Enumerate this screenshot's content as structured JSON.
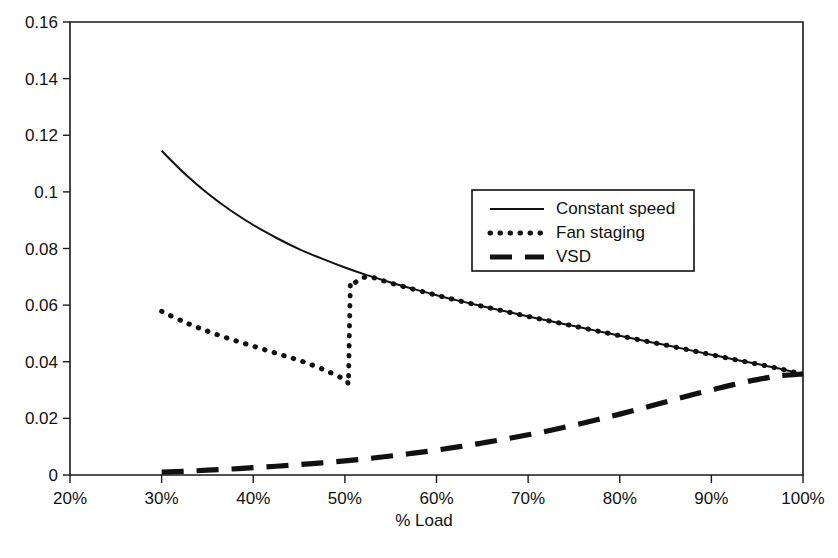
{
  "chart_data": {
    "type": "line",
    "title": "",
    "xlabel": "% Load",
    "ylabel": "",
    "xlim": [
      20,
      100
    ],
    "ylim": [
      0,
      0.16
    ],
    "grid": false,
    "legend_position": "inside-upper-right",
    "x_tick_labels": [
      "20%",
      "30%",
      "40%",
      "50%",
      "60%",
      "70%",
      "80%",
      "90%",
      "100%"
    ],
    "x_tick_values": [
      20,
      30,
      40,
      50,
      60,
      70,
      80,
      90,
      100
    ],
    "y_tick_labels": [
      "0",
      "0.02",
      "0.04",
      "0.06",
      "0.08",
      "0.1",
      "0.12",
      "0.14",
      "0.16"
    ],
    "y_tick_values": [
      0,
      0.02,
      0.04,
      0.06,
      0.08,
      0.1,
      0.12,
      0.14,
      0.16
    ],
    "series": [
      {
        "name": "Constant speed",
        "style": "solid",
        "x": [
          30,
          32.5,
          35,
          37.5,
          40,
          42.5,
          45,
          47.5,
          50,
          52.5,
          55,
          57.5,
          60,
          62.5,
          65,
          67.5,
          70,
          72.5,
          75,
          77.5,
          80,
          82.5,
          85,
          87.5,
          90,
          92.5,
          95,
          97.5,
          100
        ],
        "values": [
          0.1145,
          0.1065,
          0.0995,
          0.0935,
          0.0883,
          0.0838,
          0.0798,
          0.0764,
          0.0733,
          0.0705,
          0.068,
          0.0657,
          0.0635,
          0.0615,
          0.0596,
          0.0578,
          0.056,
          0.0543,
          0.0526,
          0.0509,
          0.0492,
          0.0475,
          0.0459,
          0.0442,
          0.0425,
          0.0408,
          0.0392,
          0.0375,
          0.0355
        ]
      },
      {
        "name": "Fan staging",
        "style": "dotted",
        "x": [
          30,
          32.5,
          35,
          37.5,
          40,
          42.5,
          45,
          47.5,
          50,
          50.4,
          50.5,
          50.6,
          51,
          52.5,
          55,
          57.5,
          60,
          62.5,
          65,
          67.5,
          70,
          72.5,
          75,
          77.5,
          80,
          82.5,
          85,
          87.5,
          90,
          92.5,
          95,
          97.5,
          100
        ],
        "values": [
          0.0578,
          0.054,
          0.0508,
          0.048,
          0.0455,
          0.043,
          0.0405,
          0.0375,
          0.0338,
          0.0335,
          0.052,
          0.0672,
          0.0678,
          0.07,
          0.0678,
          0.0656,
          0.0635,
          0.0615,
          0.0596,
          0.0578,
          0.056,
          0.0543,
          0.0526,
          0.0509,
          0.0492,
          0.0475,
          0.0459,
          0.0442,
          0.0425,
          0.0408,
          0.0392,
          0.0375,
          0.0355
        ]
      },
      {
        "name": "VSD",
        "style": "dashed",
        "x": [
          30,
          32.5,
          35,
          37.5,
          40,
          42.5,
          45,
          47.5,
          50,
          52.5,
          55,
          57.5,
          60,
          62.5,
          65,
          67.5,
          70,
          72.5,
          75,
          77.5,
          80,
          82.5,
          85,
          87.5,
          90,
          92.5,
          95,
          97.5,
          100
        ],
        "values": [
          0.001,
          0.0013,
          0.0017,
          0.0021,
          0.0026,
          0.0031,
          0.0037,
          0.0043,
          0.005,
          0.0058,
          0.0067,
          0.0077,
          0.0088,
          0.01,
          0.0113,
          0.0127,
          0.0142,
          0.0158,
          0.0176,
          0.0195,
          0.0215,
          0.0236,
          0.0258,
          0.028,
          0.03,
          0.032,
          0.0337,
          0.035,
          0.0357
        ]
      }
    ]
  },
  "legend": {
    "items": [
      {
        "label": "Constant speed",
        "style": "solid"
      },
      {
        "label": "Fan staging",
        "style": "dotted"
      },
      {
        "label": "VSD",
        "style": "dashed"
      }
    ]
  }
}
